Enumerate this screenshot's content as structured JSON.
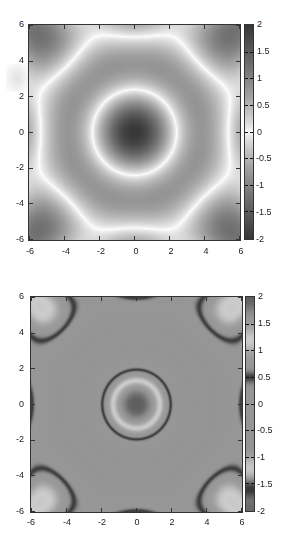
{
  "chart_data": [
    {
      "type": "heatmap",
      "title": "",
      "xlabel": "",
      "ylabel": "",
      "xlim": [
        -6,
        6
      ],
      "ylim": [
        -6,
        6
      ],
      "xticks": [
        "-6",
        "-4",
        "-2",
        "0",
        "2",
        "4",
        "6"
      ],
      "yticks": [
        "6",
        "4",
        "2",
        "0",
        "-2",
        "-4",
        "-6"
      ],
      "colorbar": {
        "range": [
          -2,
          2
        ],
        "ticks": [
          "2",
          "1.5",
          "1",
          "0.5",
          "0",
          "-0.5",
          "-1",
          "-1.5",
          "-2"
        ],
        "colormap": "grayscale: dark at ±2, white at 0"
      },
      "pattern": "8-fold symmetric quasi-periodic interference pattern; dark spots at (±3.14, ±3.14) and ring at origin",
      "grid": false,
      "legend": "colorbar right"
    },
    {
      "type": "heatmap",
      "title": "",
      "xlabel": "",
      "ylabel": "",
      "xlim": [
        -6,
        6
      ],
      "ylim": [
        -6,
        6
      ],
      "xticks": [
        "-6",
        "-4",
        "-2",
        "0",
        "2",
        "4",
        "6"
      ],
      "yticks": [
        "6",
        "4",
        "2",
        "0",
        "-2",
        "-4",
        "-6"
      ],
      "colorbar": {
        "range": [
          -2,
          2
        ],
        "ticks": [
          "2",
          "1.5",
          "1",
          "0.5",
          "0",
          "-0.5",
          "-1",
          "-1.5",
          "-2"
        ],
        "colormap": "banded grayscale: dark bands near 0.5 and -1.5, light near 1.2 and -1.2"
      },
      "pattern": "same 8-fold pattern rendered with banded colormap; concentric dark octagonal rings at (±3.14, ±3.14)",
      "grid": false,
      "legend": "colorbar right"
    }
  ],
  "panels": [
    {
      "xticks": [
        "-6",
        "-4",
        "-2",
        "0",
        "2",
        "4",
        "6"
      ],
      "yticks": [
        "6",
        "4",
        "2",
        "0",
        "-2",
        "-4",
        "-6"
      ],
      "cticks": [
        "2",
        "1.5",
        "1",
        "0.5",
        "0",
        "-0.5",
        "-1",
        "-1.5",
        "-2"
      ]
    },
    {
      "xticks": [
        "-6",
        "-4",
        "-2",
        "0",
        "2",
        "4",
        "6"
      ],
      "yticks": [
        "6",
        "4",
        "2",
        "0",
        "-2",
        "-4",
        "-6"
      ],
      "cticks": [
        "2",
        "1.5",
        "1",
        "0.5",
        "0",
        "-0.5",
        "-1",
        "-1.5",
        "-2"
      ]
    }
  ],
  "colors": {
    "frame": "#333333",
    "background": "#ffffff"
  }
}
